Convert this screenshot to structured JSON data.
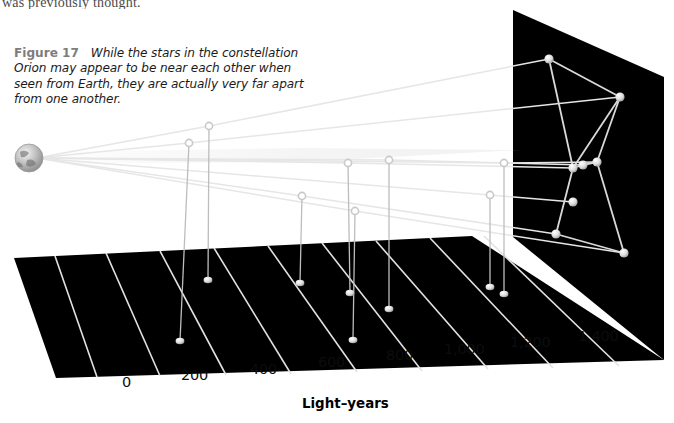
{
  "page": {
    "width": 674,
    "height": 423,
    "background": "#ffffff",
    "running_text_above": "was previously thought."
  },
  "caption": {
    "figure_number": "Figure 17",
    "text": "While the stars in the constellation Orion may appear to be near each other when seen from Earth, they are actually very far apart from one another.",
    "number_color": "#7d7d7d",
    "text_color": "#1b1b1b"
  },
  "axis": {
    "title": "Light–years",
    "title_color": "#000000",
    "ticks": [
      {
        "label": "0",
        "value": 0,
        "x": 122,
        "y": 374
      },
      {
        "label": "200",
        "value": 200,
        "x": 181,
        "y": 367
      },
      {
        "label": "400",
        "value": 400,
        "x": 250,
        "y": 361
      },
      {
        "label": "600",
        "value": 600,
        "x": 318,
        "y": 354
      },
      {
        "label": "800",
        "value": 800,
        "x": 386,
        "y": 347
      },
      {
        "label": "1,000",
        "value": 1000,
        "x": 444,
        "y": 341
      },
      {
        "label": "1,200",
        "value": 1200,
        "x": 510,
        "y": 334
      },
      {
        "label": "1,400",
        "value": 1400,
        "x": 578,
        "y": 328
      }
    ],
    "tick_color": "#0d0d0d"
  },
  "colors": {
    "ground_fill": "#000000",
    "panel_fill": "#000000",
    "grid_line": "#e2e2e2",
    "sight_line": "#e6e6e6",
    "drop_line": "#bdbdbd",
    "constellation_line": "#d9d9d9",
    "star_fill": "#d8d8d8",
    "node_stroke": "#c9c9c9",
    "earth_dark": "#6e6e6e",
    "earth_light": "#d2d2d2"
  },
  "scene": {
    "ground_plane": {
      "name": "light-years-ground-plane",
      "points": "14,258 472,236 664,360 56,378"
    },
    "back_panel": {
      "name": "night-sky-panel",
      "points": "513,10 664,77 664,360 513,237"
    },
    "grid_lines": [
      {
        "x1": 55,
        "y1": 256,
        "x2": 97,
        "y2": 377
      },
      {
        "x1": 106,
        "y1": 253,
        "x2": 160,
        "y2": 376
      },
      {
        "x1": 160,
        "y1": 251,
        "x2": 226,
        "y2": 375
      },
      {
        "x1": 214,
        "y1": 248,
        "x2": 291,
        "y2": 374
      },
      {
        "x1": 268,
        "y1": 246,
        "x2": 357,
        "y2": 372
      },
      {
        "x1": 322,
        "y1": 243,
        "x2": 422,
        "y2": 371
      },
      {
        "x1": 376,
        "y1": 241,
        "x2": 488,
        "y2": 369
      },
      {
        "x1": 430,
        "y1": 238,
        "x2": 553,
        "y2": 368
      },
      {
        "x1": 484,
        "y1": 236,
        "x2": 619,
        "y2": 366
      }
    ],
    "earth": {
      "name": "earth-globe",
      "cx": 29,
      "cy": 158,
      "r": 14
    },
    "stars": [
      {
        "name": "betelgeuse",
        "sky_x": 549,
        "sky_y": 59,
        "node_x": 209,
        "node_y": 126,
        "ground_x": 208,
        "ground_y": 280
      },
      {
        "name": "bellatrix",
        "sky_x": 620,
        "sky_y": 97,
        "node_x": 189,
        "node_y": 143,
        "ground_x": 180,
        "ground_y": 341
      },
      {
        "name": "belt-star-alnitak",
        "sky_x": 573,
        "sky_y": 168,
        "node_x": 348,
        "node_y": 163,
        "ground_x": 350,
        "ground_y": 293
      },
      {
        "name": "belt-star-alnilam",
        "sky_x": 583,
        "sky_y": 165,
        "node_x": 389,
        "node_y": 160,
        "ground_x": 389,
        "ground_y": 309
      },
      {
        "name": "belt-star-mintaka",
        "sky_x": 597,
        "sky_y": 162,
        "node_x": 504,
        "node_y": 163,
        "ground_x": 504,
        "ground_y": 294
      },
      {
        "name": "saiph",
        "sky_x": 556,
        "sky_y": 234,
        "node_x": 302,
        "node_y": 196,
        "ground_x": 300,
        "ground_y": 283
      },
      {
        "name": "rigel",
        "sky_x": 624,
        "sky_y": 253,
        "node_x": 355,
        "node_y": 211,
        "ground_x": 353,
        "ground_y": 340
      },
      {
        "name": "meissa",
        "sky_x": 573,
        "sky_y": 202,
        "node_x": 490,
        "node_y": 195,
        "ground_x": 490,
        "ground_y": 287
      }
    ],
    "constellation_links": [
      [
        "betelgeuse",
        "belt-star-alnitak"
      ],
      [
        "betelgeuse",
        "bellatrix"
      ],
      [
        "bellatrix",
        "belt-star-alnitak"
      ],
      [
        "belt-star-alnitak",
        "belt-star-alnilam"
      ],
      [
        "belt-star-alnilam",
        "belt-star-mintaka"
      ],
      [
        "belt-star-mintaka",
        "rigel"
      ],
      [
        "belt-star-alnitak",
        "saiph"
      ],
      [
        "saiph",
        "rigel"
      ],
      [
        "bellatrix",
        "belt-star-mintaka"
      ]
    ]
  }
}
